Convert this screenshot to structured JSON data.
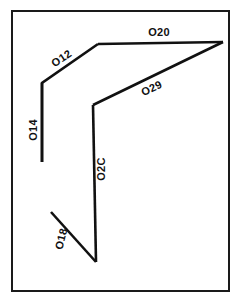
{
  "figure": {
    "background_color": "#ffffff",
    "line_color": "#111111",
    "frame_color": "#1a1a1a",
    "width": 241,
    "height": 301
  },
  "frame": {
    "x": 12,
    "y": 11,
    "width": 217,
    "height": 280
  },
  "labels": {
    "top": "O20",
    "upper_left_diagonal": "O12",
    "left_vertical": "O14",
    "right_diagonal": "O29",
    "center_vertical": "O2C",
    "bottom_left_diagonal": "O18"
  },
  "segments": [
    {
      "name": "O12",
      "label": "O12",
      "path": "M 42 162 L 42 83 L 98 44",
      "label_x": 62,
      "label_y": 59,
      "label_rotation": -34,
      "label_anchor": "middle"
    },
    {
      "name": "O14",
      "label": "O14",
      "path": "M 42 83 L 42 162",
      "label_x": 34,
      "label_y": 130,
      "label_rotation": -90,
      "label_anchor": "middle"
    },
    {
      "name": "O20",
      "label": "O20",
      "path": "M 98 44 L 223 42",
      "label_x": 159,
      "label_y": 33,
      "label_rotation": 0,
      "label_anchor": "middle"
    },
    {
      "name": "O29",
      "label": "O29",
      "path": "M 223 42 L 93 105",
      "label_x": 152,
      "label_y": 89,
      "label_rotation": -26,
      "label_anchor": "middle"
    },
    {
      "name": "O2C",
      "label": "O2C",
      "path": "M 93 105 L 96 262",
      "label_x": 102,
      "label_y": 169,
      "label_rotation": -90,
      "label_anchor": "middle"
    },
    {
      "name": "O18",
      "label": "O18",
      "path": "M 51 212 L 96 262",
      "label_x": 62,
      "label_y": 239,
      "label_rotation": -76,
      "label_anchor": "middle"
    }
  ]
}
